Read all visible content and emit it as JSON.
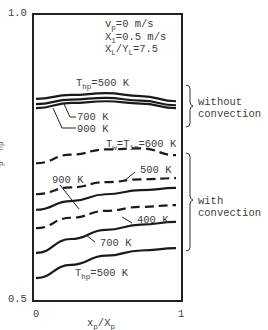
{
  "chart_data": {
    "type": "line",
    "title": "",
    "xlabel": "x_p/X_p",
    "ylabel": "T_p^4/T_hp^4",
    "xlim": [
      0,
      1
    ],
    "ylim": [
      0.5,
      1.0
    ],
    "x_ticks": [
      "0",
      "1"
    ],
    "y_ticks": [
      "0.5",
      "1.0"
    ],
    "grid": false,
    "legend": null,
    "parameters": [
      "v_p=0 m/s",
      "X_1=0.5 m/s",
      "X_L/Y_L=7.5"
    ],
    "annotations": [
      {
        "text": "without convection",
        "groups": [
          "Thp=500 K",
          "700 K",
          "900 K"
        ]
      },
      {
        "text": "with convection",
        "groups": [
          "Tw=Tin=600 K",
          "500 K",
          "900 K",
          "400 K",
          "700 K",
          "Thp=500 K"
        ]
      }
    ],
    "x": [
      0,
      0.25,
      0.5,
      0.75,
      1.0
    ],
    "series": [
      {
        "name": "Thp=500 K (without convection)",
        "style": "solid",
        "group": "without convection",
        "values": [
          0.852,
          0.859,
          0.862,
          0.857,
          0.848
        ]
      },
      {
        "name": "Thp=700 K (without convection)",
        "style": "solid",
        "group": "without convection",
        "values": [
          0.843,
          0.851,
          0.854,
          0.849,
          0.841
        ]
      },
      {
        "name": "Thp=900 K (without convection)",
        "style": "solid",
        "group": "without convection",
        "values": [
          0.836,
          0.845,
          0.848,
          0.844,
          0.836
        ]
      },
      {
        "name": "Tw=Tin=600 K",
        "style": "dashed",
        "group": "with convection",
        "values": [
          0.74,
          0.755,
          0.764,
          0.766,
          0.754
        ]
      },
      {
        "name": "Tw=Tin=500 K",
        "style": "dashed",
        "group": "with convection",
        "values": [
          0.686,
          0.698,
          0.707,
          0.712,
          0.714
        ]
      },
      {
        "name": "Thp=900 K (with convection)",
        "style": "solid",
        "group": "with convection",
        "values": [
          0.659,
          0.674,
          0.686,
          0.693,
          0.697
        ]
      },
      {
        "name": "Tw=Tin=400 K",
        "style": "dashed",
        "group": "with convection",
        "values": [
          0.627,
          0.645,
          0.657,
          0.664,
          0.667
        ]
      },
      {
        "name": "Thp=700 K (with convection)",
        "style": "solid",
        "group": "with convection",
        "values": [
          0.584,
          0.608,
          0.624,
          0.633,
          0.638
        ]
      },
      {
        "name": "Thp=500 K (with convection)",
        "style": "solid",
        "group": "with convection",
        "values": [
          0.54,
          0.563,
          0.579,
          0.588,
          0.592
        ]
      }
    ]
  },
  "labels": {
    "y_tick_top": "1.0",
    "y_tick_bottom": "0.5",
    "x_tick_left": "0",
    "x_tick_right": "1",
    "param1_a": "v",
    "param1_sub": "p",
    "param1_b": "=0 m/s",
    "param2_a": "X",
    "param2_sub": "1",
    "param2_b": "=0.5 m/s",
    "param3_a": "X",
    "param3_sub": "L",
    "param3_b": "/Y",
    "param3_sub2": "L",
    "param3_c": "=7.5",
    "top_thp_a": "T",
    "top_thp_sub": "hp",
    "top_thp_b": "=500 K",
    "top_700": "700 K",
    "top_900": "900 K",
    "tw_a": "T",
    "tw_sub": "w",
    "tw_b": "=T",
    "tw_sub2": "in",
    "tw_c": "=600 K",
    "dash_500": "500 K",
    "solid_900": "900 K",
    "dash_400": "400 K",
    "solid_700": "700 K",
    "bot_thp_a": "T",
    "bot_thp_sub": "hp",
    "bot_thp_b": "=500 K",
    "without": "without",
    "without_conv": "convection",
    "with": "with",
    "with_conv": "convection",
    "xlabel_a": "x",
    "xlabel_sub": "p",
    "xlabel_b": "/X",
    "xlabel_sub2": "p",
    "ylabel_a": "T",
    "ylabel_sub": "p",
    "ylabel_sup": "4",
    "ylabel_b": "/T",
    "ylabel_sup2": "4",
    "ylabel_sub2": "hp"
  }
}
